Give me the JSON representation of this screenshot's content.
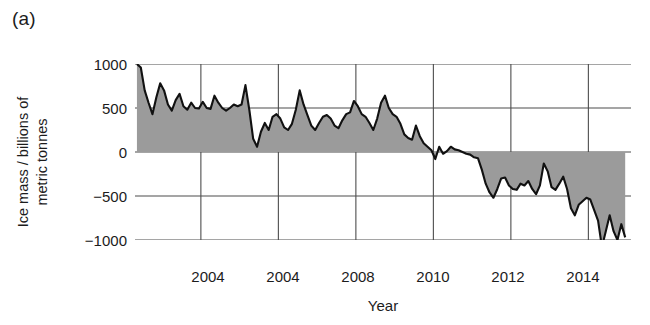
{
  "figure": {
    "panel_label": "(a)",
    "background": "#ffffff"
  },
  "axes": {
    "ylabel": "Ice mass / billions of\nmetric tonnes",
    "xlabel": "Year",
    "ytick_labels": [
      "1000",
      "500",
      "0",
      "−500",
      "−1000"
    ],
    "xtick_labels": [
      "2004",
      "2004",
      "2008",
      "2010",
      "2012",
      "2014"
    ],
    "line_color": "#111111",
    "fill_color": "#9b9b9b",
    "grid_color": "#4d4d4d"
  },
  "chart_data": {
    "type": "area",
    "title": "",
    "xlabel": "Year",
    "ylabel": "Ice mass / billions of metric tonnes",
    "xlim": [
      2002.3,
      2015.1
    ],
    "ylim": [
      -1000,
      1000
    ],
    "xtick_values": [
      2004,
      2006,
      2008,
      2010,
      2012,
      2014
    ],
    "xtick_labels": [
      "2004",
      "2004",
      "2008",
      "2010",
      "2012",
      "2014"
    ],
    "ytick_values": [
      1000,
      500,
      0,
      -500,
      -1000
    ],
    "ytick_labels": [
      "1000",
      "500",
      "0",
      "−500",
      "−1000"
    ],
    "grid": true,
    "legend": "none",
    "baseline": 0,
    "series": [
      {
        "name": "Ice mass anomaly",
        "x": [
          2002.35,
          2002.45,
          2002.55,
          2002.65,
          2002.75,
          2002.85,
          2002.95,
          2003.05,
          2003.15,
          2003.25,
          2003.35,
          2003.45,
          2003.55,
          2003.65,
          2003.75,
          2003.85,
          2003.95,
          2004.05,
          2004.15,
          2004.25,
          2004.35,
          2004.45,
          2004.55,
          2004.65,
          2004.75,
          2004.85,
          2004.95,
          2005.05,
          2005.15,
          2005.25,
          2005.35,
          2005.45,
          2005.55,
          2005.65,
          2005.75,
          2005.85,
          2005.95,
          2006.05,
          2006.15,
          2006.25,
          2006.35,
          2006.45,
          2006.55,
          2006.65,
          2006.75,
          2006.85,
          2006.95,
          2007.05,
          2007.15,
          2007.25,
          2007.35,
          2007.45,
          2007.55,
          2007.65,
          2007.75,
          2007.85,
          2007.95,
          2008.05,
          2008.15,
          2008.25,
          2008.35,
          2008.45,
          2008.55,
          2008.65,
          2008.75,
          2008.85,
          2008.95,
          2009.05,
          2009.15,
          2009.25,
          2009.35,
          2009.45,
          2009.55,
          2009.65,
          2009.75,
          2009.85,
          2009.95,
          2010.05,
          2010.15,
          2010.25,
          2010.35,
          2010.45,
          2010.55,
          2010.65,
          2010.75,
          2010.85,
          2010.95,
          2011.05,
          2011.15,
          2011.25,
          2011.35,
          2011.45,
          2011.55,
          2011.65,
          2011.75,
          2011.85,
          2011.95,
          2012.05,
          2012.15,
          2012.25,
          2012.35,
          2012.45,
          2012.55,
          2012.65,
          2012.75,
          2012.85,
          2012.95,
          2013.05,
          2013.15,
          2013.25,
          2013.35,
          2013.45,
          2013.55,
          2013.65,
          2013.75,
          2013.85,
          2013.95,
          2014.05,
          2014.15,
          2014.25,
          2014.35,
          2014.45,
          2014.55,
          2014.65,
          2014.75,
          2014.85,
          2014.95
        ],
        "y": [
          1000,
          960,
          700,
          560,
          430,
          620,
          780,
          700,
          540,
          470,
          590,
          660,
          520,
          480,
          560,
          500,
          495,
          570,
          500,
          490,
          640,
          560,
          500,
          470,
          500,
          540,
          520,
          540,
          760,
          480,
          150,
          60,
          230,
          330,
          250,
          400,
          430,
          380,
          280,
          250,
          320,
          480,
          700,
          540,
          420,
          300,
          250,
          330,
          400,
          420,
          380,
          300,
          270,
          360,
          430,
          450,
          580,
          520,
          430,
          400,
          330,
          250,
          380,
          560,
          640,
          500,
          430,
          400,
          320,
          200,
          160,
          140,
          300,
          180,
          100,
          60,
          20,
          -80,
          60,
          -20,
          10,
          60,
          30,
          20,
          0,
          -20,
          -30,
          -60,
          -70,
          -200,
          -360,
          -460,
          -520,
          -420,
          -300,
          -290,
          -380,
          -420,
          -430,
          -360,
          -380,
          -330,
          -420,
          -480,
          -380,
          -130,
          -220,
          -400,
          -430,
          -360,
          -280,
          -420,
          -640,
          -720,
          -600,
          -560,
          -520,
          -540,
          -660,
          -780,
          -1080,
          -900,
          -720,
          -900,
          -1000,
          -820,
          -970
        ]
      }
    ]
  }
}
